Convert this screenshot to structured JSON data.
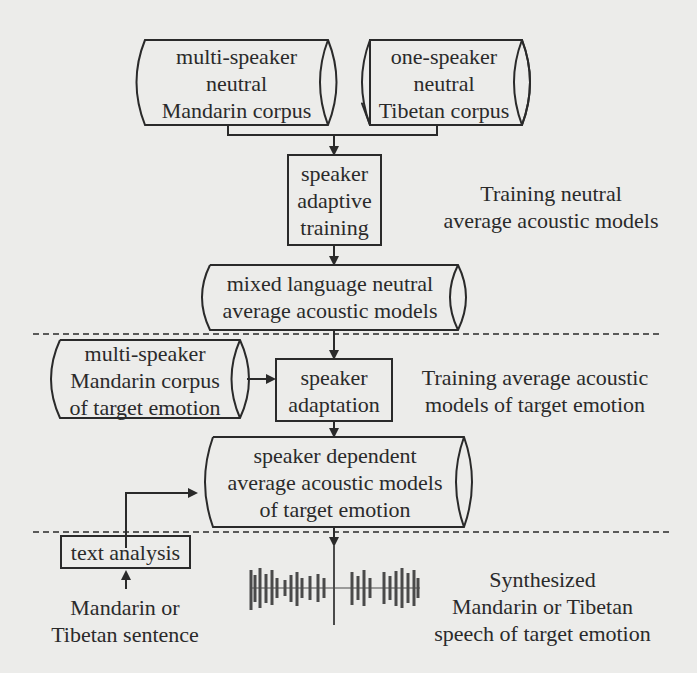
{
  "colors": {
    "background": "#ececea",
    "stroke": "#2a2a2a",
    "waveform": "#4a4a4a"
  },
  "nodes": {
    "mandarin_corpus": {
      "shape": "cylinder",
      "lines": [
        "multi-speaker",
        "neutral",
        "Mandarin corpus"
      ]
    },
    "tibetan_corpus": {
      "shape": "cylinder",
      "lines": [
        "one-speaker",
        "neutral",
        "Tibetan corpus"
      ]
    },
    "sat": {
      "shape": "box",
      "lines": [
        "speaker",
        "adaptive",
        "training"
      ]
    },
    "mixed_models": {
      "shape": "cylinder",
      "lines": [
        "mixed language neutral",
        "average acoustic models"
      ]
    },
    "emotion_corpus": {
      "shape": "cylinder",
      "lines": [
        "multi-speaker",
        "Mandarin corpus",
        "of target emotion"
      ]
    },
    "adaptation": {
      "shape": "box",
      "lines": [
        "speaker",
        "adaptation"
      ]
    },
    "sd_models": {
      "shape": "cylinder",
      "lines": [
        "speaker dependent",
        "average acoustic models",
        "of target emotion"
      ]
    },
    "text_analysis": {
      "shape": "box",
      "lines": [
        "text analysis"
      ]
    }
  },
  "labels": {
    "stage1": [
      "Training neutral",
      "average acoustic models"
    ],
    "stage2": [
      "Training average acoustic",
      "models of target emotion"
    ],
    "input": [
      "Mandarin or",
      "Tibetan sentence"
    ],
    "output": [
      "Synthesized",
      "Mandarin or Tibetan",
      "speech of target emotion"
    ]
  },
  "icons": {
    "waveform": "speech-waveform-icon"
  }
}
